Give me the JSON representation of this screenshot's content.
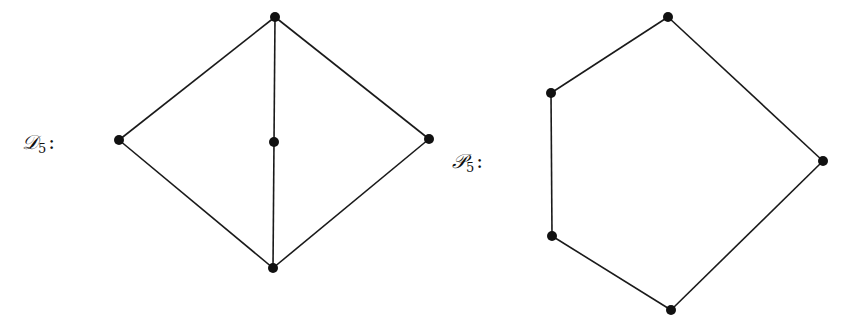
{
  "diagrams": [
    {
      "id": "D5",
      "label": {
        "letter": "𝒟",
        "subscript": "5",
        "suffix": ":"
      },
      "label_pos": [
        22,
        132
      ],
      "nodes": [
        {
          "name": "top",
          "x": 275,
          "y": 17
        },
        {
          "name": "left",
          "x": 119,
          "y": 140
        },
        {
          "name": "center",
          "x": 274,
          "y": 142
        },
        {
          "name": "right",
          "x": 429,
          "y": 139
        },
        {
          "name": "bottom",
          "x": 273,
          "y": 268
        }
      ],
      "edges": [
        [
          0,
          1
        ],
        [
          0,
          2
        ],
        [
          0,
          3
        ],
        [
          1,
          4
        ],
        [
          2,
          4
        ],
        [
          3,
          4
        ]
      ]
    },
    {
      "id": "P5",
      "label": {
        "letter": "𝒫",
        "subscript": "5",
        "suffix": ":"
      },
      "label_pos": [
        452,
        151
      ],
      "nodes": [
        {
          "name": "top",
          "x": 668,
          "y": 17
        },
        {
          "name": "upper-left",
          "x": 551,
          "y": 93
        },
        {
          "name": "right",
          "x": 823,
          "y": 161
        },
        {
          "name": "lower-left",
          "x": 552,
          "y": 236
        },
        {
          "name": "bottom",
          "x": 671,
          "y": 310
        }
      ],
      "edges": [
        [
          0,
          1
        ],
        [
          0,
          2
        ],
        [
          1,
          3
        ],
        [
          3,
          4
        ],
        [
          2,
          4
        ]
      ]
    }
  ],
  "style": {
    "node_radius": 5,
    "edge_color": "#1a1a1a",
    "node_color": "#111111"
  }
}
